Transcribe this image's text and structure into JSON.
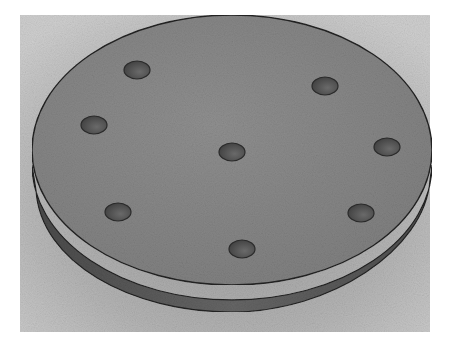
{
  "image": {
    "subject": "3D rendered circular disc with holes",
    "background_color": "#ffffff",
    "panel_color": "#bdbdbd",
    "disc_top_color": "#8a8a8a",
    "disc_side_color": "#5e5e5e",
    "hole_color": "#555555",
    "hole_count": 8,
    "holes": [
      {
        "cx": 137,
        "cy": 70
      },
      {
        "cx": 325,
        "cy": 86
      },
      {
        "cx": 94,
        "cy": 125
      },
      {
        "cx": 232,
        "cy": 152
      },
      {
        "cx": 387,
        "cy": 147
      },
      {
        "cx": 118,
        "cy": 212
      },
      {
        "cx": 361,
        "cy": 213
      },
      {
        "cx": 242,
        "cy": 249
      }
    ]
  }
}
